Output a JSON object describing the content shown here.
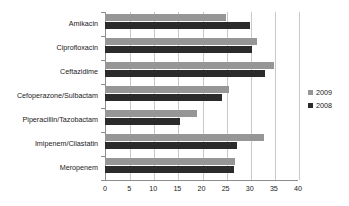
{
  "chart_data": {
    "type": "bar",
    "orientation": "horizontal",
    "title": "",
    "xlabel": "",
    "ylabel": "",
    "xlim": [
      0,
      40
    ],
    "xticks": [
      0,
      5,
      10,
      15,
      20,
      25,
      30,
      35,
      40
    ],
    "grid": true,
    "legend_position": "right",
    "categories": [
      "Amikacin",
      "Ciprofloxacin",
      "Ceftazidime",
      "Cefoperazone/Sulbactam",
      "Piperacillin/Tazobactam",
      "Imipenem/Cilastatin",
      "Meropenem"
    ],
    "series": [
      {
        "name": "2009",
        "color": "#969696",
        "values": [
          25.0,
          31.5,
          35.0,
          25.7,
          19.0,
          33.0,
          27.0
        ]
      },
      {
        "name": "2008",
        "color": "#2b2b2b",
        "values": [
          30.0,
          30.5,
          33.2,
          24.3,
          15.5,
          27.3,
          26.8
        ]
      }
    ]
  },
  "legend": {
    "items": [
      {
        "label": "2009",
        "color": "#969696"
      },
      {
        "label": "2008",
        "color": "#2b2b2b"
      }
    ]
  },
  "xticklabels": [
    "0",
    "5",
    "10",
    "15",
    "20",
    "25",
    "30",
    "35",
    "40"
  ]
}
